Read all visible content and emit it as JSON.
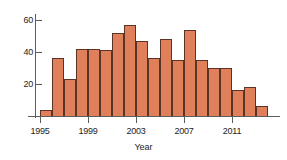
{
  "chart_data": {
    "type": "bar",
    "title": "",
    "subtitle": "",
    "xlabel": "Year",
    "ylabel": "",
    "categories": [
      1995,
      1996,
      1997,
      1998,
      1999,
      2000,
      2001,
      2002,
      2003,
      2004,
      2005,
      2006,
      2007,
      2008,
      2009,
      2010,
      2011,
      2012,
      2013,
      2014
    ],
    "values": [
      4,
      36,
      23,
      42,
      42,
      41,
      52,
      57,
      47,
      36,
      48,
      35,
      54,
      35,
      30,
      30,
      16,
      18,
      6,
      0
    ],
    "series": [
      {
        "name": "count",
        "values": [
          4,
          36,
          23,
          42,
          42,
          41,
          52,
          57,
          47,
          36,
          48,
          35,
          54,
          35,
          30,
          30,
          16,
          18,
          6,
          0
        ]
      }
    ],
    "bars": [
      {
        "year": 1995,
        "value": 4
      },
      {
        "year": 1996,
        "value": 36
      },
      {
        "year": 1997,
        "value": 23
      },
      {
        "year": 1998,
        "value": 42
      },
      {
        "year": 1999,
        "value": 42
      },
      {
        "year": 2000,
        "value": 41
      },
      {
        "year": 2001,
        "value": 52
      },
      {
        "year": 2002,
        "value": 57
      },
      {
        "year": 2003,
        "value": 47
      },
      {
        "year": 2004,
        "value": 36
      },
      {
        "year": 2005,
        "value": 48
      },
      {
        "year": 2006,
        "value": 35
      },
      {
        "year": 2007,
        "value": 54
      },
      {
        "year": 2008,
        "value": 35
      },
      {
        "year": 2009,
        "value": 30
      },
      {
        "year": 2010,
        "value": 30
      },
      {
        "year": 2011,
        "value": 16
      },
      {
        "year": 2012,
        "value": 18
      },
      {
        "year": 2013,
        "value": 6
      }
    ],
    "xlim": [
      1995,
      2014
    ],
    "ylim": [
      0,
      64
    ],
    "y_ticks": [
      20,
      40,
      60
    ],
    "y_tick_labels": [
      "20",
      "40",
      "60"
    ],
    "x_ticks": [
      1995,
      1999,
      2003,
      2007,
      2011
    ],
    "x_tick_labels": [
      "1995",
      "1999",
      "2003",
      "2007",
      "2011"
    ],
    "grid": false,
    "legend": false,
    "legend_position": "none",
    "bar_fill_color": "#e0805b",
    "bar_edge_color": "#5a3426",
    "axis_color": "#5d5d5d",
    "background_color": "#ffffff",
    "text_color": "#1c1c1c"
  }
}
